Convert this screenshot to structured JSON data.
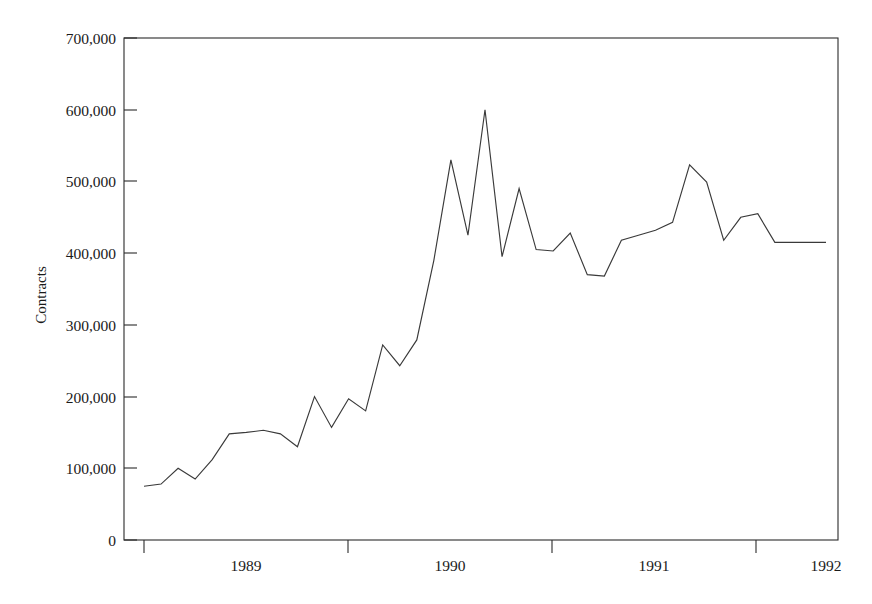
{
  "chart_data": {
    "type": "line",
    "title": "",
    "xlabel": "",
    "ylabel": "Contracts",
    "ylim": [
      0,
      700000
    ],
    "grid": false,
    "legend": null,
    "y_ticks": [
      0,
      100000,
      200000,
      300000,
      400000,
      500000,
      600000,
      700000
    ],
    "y_tick_labels": [
      "0",
      "100,000",
      "200,000",
      "300,000",
      "400,000",
      "500,000",
      "600,000",
      "700,000"
    ],
    "x_tick_labels": [
      "1989",
      "1990",
      "1991",
      "1992"
    ],
    "x_axis_note": "Monthly observations spanning late 1988 through early 1992; year labels are centered between major ticks.",
    "xlim": [
      0,
      41
    ],
    "x": [
      0,
      1,
      2,
      3,
      4,
      5,
      6,
      7,
      8,
      9,
      10,
      11,
      12,
      13,
      14,
      15,
      16,
      17,
      18,
      19,
      20,
      21,
      22,
      23,
      24,
      25,
      26,
      27,
      28,
      29,
      30,
      31,
      32,
      33,
      34,
      35,
      36,
      37,
      38,
      39,
      40
    ],
    "values": [
      75000,
      78000,
      100000,
      85000,
      112000,
      148000,
      150000,
      153000,
      148000,
      130000,
      200000,
      157000,
      197000,
      180000,
      272000,
      243000,
      279000,
      390000,
      530000,
      425000,
      600000,
      395000,
      490000,
      405000,
      403000,
      428000,
      370000,
      368000,
      418000,
      425000,
      432000,
      443000,
      523000,
      499000,
      418000,
      450000,
      455000,
      415000,
      415000,
      415000,
      415000
    ],
    "series_name": "Contracts",
    "line_color": "#3a3a3a",
    "axis_color": "#2b2b2b",
    "background_color": "#ffffff",
    "annotations": []
  },
  "figure": {
    "plot_left_px": 124,
    "plot_right_px": 838,
    "plot_top_px": 38,
    "plot_bottom_px": 540
  }
}
